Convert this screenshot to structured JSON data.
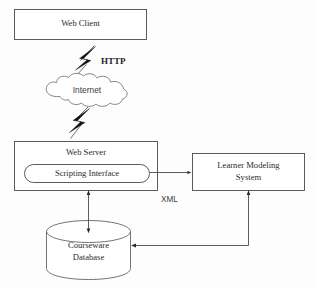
{
  "diagram": {
    "background_color": "#fdfdfd",
    "stroke_color": "#4a4a4a",
    "text_color": "#2b2b2b",
    "nodes": {
      "web_client": {
        "label": "Web Client",
        "shape": "rectangle"
      },
      "internet": {
        "label": "Internet",
        "shape": "cloud"
      },
      "web_server": {
        "label": "Web Server",
        "shape": "rectangle"
      },
      "scripting_interface": {
        "label": "Scripting Interface",
        "shape": "rounded-rectangle"
      },
      "learner_modeling_system": {
        "label_line1": "Learner Modeling",
        "label_line2": "System",
        "shape": "rectangle"
      },
      "courseware_database": {
        "label_line1": "Courseware",
        "label_line2": "Database",
        "shape": "cylinder"
      }
    },
    "edge_labels": {
      "http": "HTTP",
      "xml": "XML"
    },
    "connectors": [
      {
        "name": "client-to-internet",
        "style": "lightning-bolt",
        "label": "HTTP"
      },
      {
        "name": "internet-to-server",
        "style": "lightning-bolt",
        "label": ""
      },
      {
        "name": "scripting-to-learner-model",
        "style": "arrow",
        "label": "XML"
      },
      {
        "name": "server-to-database",
        "style": "double-arrow",
        "label": ""
      },
      {
        "name": "learner-model-to-database",
        "style": "arrow",
        "label": ""
      }
    ]
  }
}
